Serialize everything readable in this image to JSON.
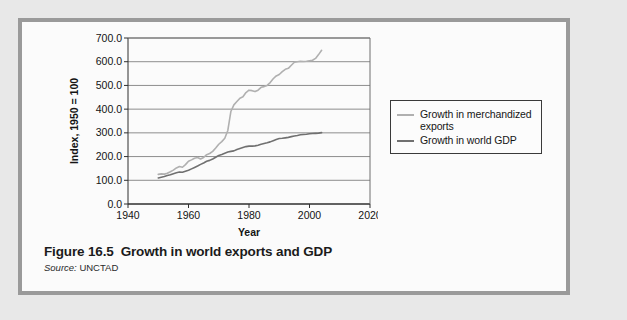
{
  "figure": {
    "caption_number": "Figure 16.5",
    "caption_title": "Growth in world exports and GDP",
    "source_word": "Source:",
    "source_value": "UNCTAD"
  },
  "legend": {
    "position": "right",
    "items": [
      {
        "label": "Growth in merchandized exports",
        "color": "#b0b0b0"
      },
      {
        "label": "Growth in world GDP",
        "color": "#707070"
      }
    ]
  },
  "chart_data": {
    "type": "line",
    "title": "",
    "xlabel": "Year",
    "ylabel": "Index, 1950 = 100",
    "xlim": [
      1940,
      2020
    ],
    "ylim": [
      0,
      700
    ],
    "xticks": [
      1940,
      1960,
      1980,
      2000,
      2020
    ],
    "xtick_labels": [
      "1940",
      "1960",
      "1980",
      "2000",
      "2020"
    ],
    "yticks": [
      0,
      100,
      200,
      300,
      400,
      500,
      600,
      700
    ],
    "ytick_labels": [
      "0.0",
      "100.0",
      "200.0",
      "300.0",
      "400.0",
      "500.0",
      "600.0",
      "700.0"
    ],
    "grid": "horizontal",
    "series": [
      {
        "name": "Growth in merchandized exports",
        "color": "#b0b0b0",
        "x": [
          1950,
          1951,
          1952,
          1953,
          1954,
          1955,
          1956,
          1957,
          1958,
          1959,
          1960,
          1961,
          1962,
          1963,
          1964,
          1965,
          1966,
          1967,
          1968,
          1969,
          1970,
          1971,
          1972,
          1973,
          1974,
          1975,
          1976,
          1977,
          1978,
          1979,
          1980,
          1981,
          1982,
          1983,
          1984,
          1985,
          1986,
          1987,
          1988,
          1989,
          1990,
          1991,
          1992,
          1993,
          1994,
          1995,
          1996,
          1997,
          1998,
          1999,
          2000,
          2001,
          2002,
          2003,
          2004
        ],
        "y": [
          125,
          127,
          126,
          130,
          136,
          143,
          152,
          158,
          155,
          166,
          180,
          186,
          193,
          196,
          190,
          196,
          208,
          213,
          222,
          236,
          252,
          263,
          277,
          310,
          390,
          418,
          432,
          446,
          452,
          470,
          480,
          478,
          474,
          480,
          492,
          495,
          500,
          512,
          528,
          540,
          546,
          558,
          568,
          572,
          585,
          598,
          600,
          602,
          601,
          602,
          604,
          606,
          614,
          630,
          648
        ]
      },
      {
        "name": "Growth in world GDP",
        "color": "#707070",
        "x": [
          1950,
          1951,
          1952,
          1953,
          1954,
          1955,
          1956,
          1957,
          1958,
          1959,
          1960,
          1961,
          1962,
          1963,
          1964,
          1965,
          1966,
          1967,
          1968,
          1969,
          1970,
          1971,
          1972,
          1973,
          1974,
          1975,
          1976,
          1977,
          1978,
          1979,
          1980,
          1981,
          1982,
          1983,
          1984,
          1985,
          1986,
          1987,
          1988,
          1989,
          1990,
          1991,
          1992,
          1993,
          1994,
          1995,
          1996,
          1997,
          1998,
          1999,
          2000,
          2001,
          2002,
          2003,
          2004
        ],
        "y": [
          110,
          113,
          116,
          120,
          123,
          128,
          132,
          135,
          134,
          138,
          142,
          148,
          154,
          160,
          167,
          173,
          180,
          184,
          190,
          197,
          205,
          209,
          214,
          219,
          222,
          224,
          230,
          234,
          238,
          242,
          244,
          244,
          245,
          248,
          252,
          255,
          258,
          262,
          267,
          272,
          276,
          277,
          279,
          281,
          284,
          287,
          289,
          292,
          293,
          294,
          296,
          297,
          298,
          299,
          301
        ]
      }
    ]
  }
}
